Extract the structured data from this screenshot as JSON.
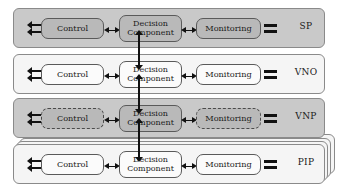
{
  "diagram": {
    "node_labels": {
      "control": "Control",
      "decision_line1": "Decision",
      "decision_line2": "Component",
      "monitoring": "Monitoring"
    },
    "icons": {
      "left_interface": "double-left-arrow-interface-icon",
      "right_interface": "plug-bars-interface-icon",
      "horizontal_link": "double-headed-horizontal-arrow",
      "vertical_link": "double-headed-vertical-arrow"
    },
    "colors": {
      "layer_dark_fill": "#c9c9c9",
      "layer_light_fill": "#f5f5f5",
      "node_dark_fill": "#b9b9b9",
      "node_light_fill": "#fbfbfb",
      "border": "#8a8a8a",
      "node_border": "#5a5a5a",
      "arrow": "#111111",
      "page_background": "#ffffff"
    },
    "layers": [
      {
        "id": "sp",
        "name": "SP",
        "shade": "dark",
        "node_fill": "dark",
        "node_border_style": "solid",
        "stacked": false
      },
      {
        "id": "vno",
        "name": "VNO",
        "shade": "light",
        "node_fill": "light",
        "node_border_style": "solid",
        "stacked": false
      },
      {
        "id": "vnp",
        "name": "VNP",
        "shade": "dark",
        "node_fill": "dark",
        "node_border_style": "dashed",
        "stacked": false
      },
      {
        "id": "pip",
        "name": "PIP",
        "shade": "light",
        "node_fill": "light",
        "node_border_style": "solid",
        "stacked": true,
        "stack_count": 3
      }
    ],
    "vertical_links": [
      {
        "from": "sp",
        "to": "vno"
      },
      {
        "from": "vno",
        "to": "vnp"
      },
      {
        "from": "vnp",
        "to": "pip"
      }
    ]
  }
}
